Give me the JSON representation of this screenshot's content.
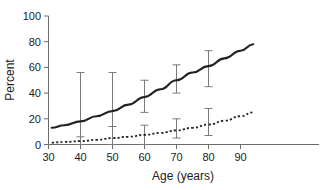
{
  "chart_data": {
    "type": "line",
    "title": "",
    "subtitle": "",
    "xlabel": "Age (years)",
    "ylabel": "Percent",
    "xlim": [
      28,
      95
    ],
    "ylim": [
      0,
      100
    ],
    "grid": false,
    "legend_position": "none",
    "xticks": [
      30,
      40,
      50,
      60,
      70,
      80,
      90
    ],
    "xtick_labels": [
      "30",
      "40",
      "50",
      "60",
      "70",
      "80",
      "90"
    ],
    "yticks": [
      0,
      20,
      40,
      60,
      80,
      100
    ],
    "ytick_labels": [
      "0",
      "20",
      "40",
      "60",
      "80",
      "100"
    ],
    "annotations": [],
    "series": [
      {
        "name": "solid-curve",
        "style": "solid",
        "color": "#222222",
        "x": [
          31,
          35,
          40,
          45,
          50,
          55,
          60,
          65,
          70,
          75,
          80,
          85,
          90,
          94
        ],
        "values": [
          13,
          15,
          18,
          22,
          26,
          31,
          37,
          43,
          50,
          56,
          61,
          67,
          73,
          78
        ],
        "error_bars": [
          {
            "x": 40,
            "y": 18,
            "low": 0,
            "high": 56
          },
          {
            "x": 50,
            "y": 26,
            "low": 0,
            "high": 56
          },
          {
            "x": 60,
            "y": 37,
            "low": 25,
            "high": 50
          },
          {
            "x": 70,
            "y": 50,
            "low": 40,
            "high": 62
          },
          {
            "x": 80,
            "y": 61,
            "low": 45,
            "high": 73
          }
        ]
      },
      {
        "name": "dotted-curve",
        "style": "dotted",
        "color": "#222222",
        "x": [
          31,
          35,
          40,
          45,
          50,
          55,
          60,
          65,
          70,
          75,
          80,
          85,
          90,
          94
        ],
        "values": [
          1.5,
          2,
          2.6,
          3.6,
          5,
          6,
          7.5,
          9,
          11,
          13,
          15.5,
          18.5,
          22,
          25
        ],
        "error_bars": [
          {
            "x": 40,
            "y": 2.6,
            "low": 0,
            "high": 6
          },
          {
            "x": 50,
            "y": 5,
            "low": 0,
            "high": 14
          },
          {
            "x": 60,
            "y": 7.5,
            "low": 0,
            "high": 15
          },
          {
            "x": 70,
            "y": 11,
            "low": 5,
            "high": 20
          },
          {
            "x": 80,
            "y": 15.5,
            "low": 7,
            "high": 28
          }
        ]
      }
    ]
  },
  "axes": {
    "ylabel": "Percent",
    "xlabel": "Age (years)"
  }
}
